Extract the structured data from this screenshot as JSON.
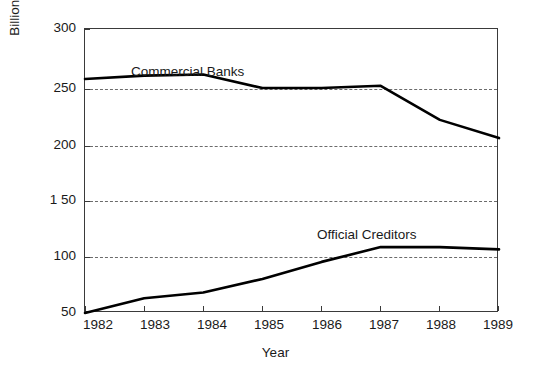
{
  "chart_data": {
    "type": "line",
    "title": "",
    "xlabel": "Year",
    "ylabel": "Billions of 1982 Dollars",
    "x": [
      1982,
      1983,
      1984,
      1985,
      1986,
      1987,
      1988,
      1989
    ],
    "xtick_labels": [
      "1982",
      "1983",
      "1984",
      "1985",
      "1986",
      "1987",
      "1988",
      "1989"
    ],
    "ytick_labels": [
      "300",
      "250",
      "200",
      "1 50",
      "100",
      "50"
    ],
    "ytick_values": [
      300,
      250,
      200,
      150,
      100,
      50
    ],
    "ylim": [
      50,
      300
    ],
    "xlim": [
      1982,
      1989
    ],
    "grid": "horizontal-dashed",
    "legend": "inline-labels",
    "series": [
      {
        "name": "Commercial Banks",
        "label_text": "Commercial Banks",
        "values": [
          256,
          259,
          260,
          248,
          248,
          250,
          220,
          204
        ]
      },
      {
        "name": "Official Creditors",
        "label_text": "Official Creditors",
        "values": [
          50,
          63,
          68,
          80,
          95,
          108,
          108,
          106
        ]
      }
    ],
    "annotations": [
      {
        "text": "Commercial Banks",
        "x": 1982.9,
        "y": 276
      },
      {
        "text": "Official Creditors",
        "x": 1986.0,
        "y": 124
      }
    ]
  }
}
